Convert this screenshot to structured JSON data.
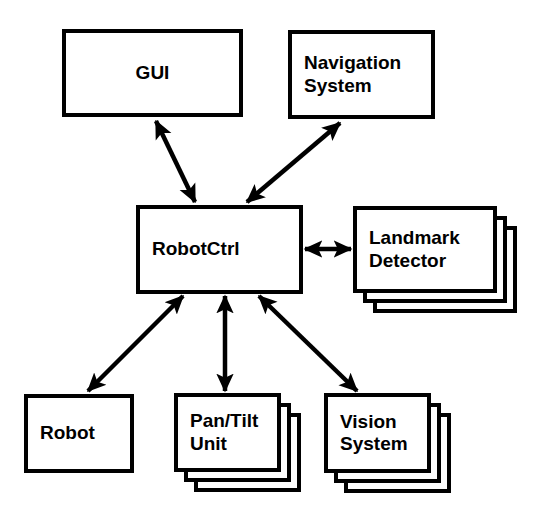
{
  "diagram": {
    "background_color": "#ffffff",
    "line_color": "#000000",
    "nodes": [
      {
        "id": "gui",
        "label": "GUI",
        "x": 62,
        "y": 29,
        "w": 181,
        "h": 88,
        "stacked": false,
        "stack_count": 1,
        "align": "center"
      },
      {
        "id": "navigation-system",
        "label": "Navigation\nSystem",
        "x": 288,
        "y": 30,
        "w": 147,
        "h": 89,
        "stacked": false,
        "stack_count": 1,
        "align": "left"
      },
      {
        "id": "robotctrl",
        "label": "RobotCtrl",
        "x": 136,
        "y": 205,
        "w": 167,
        "h": 89,
        "stacked": false,
        "stack_count": 1,
        "align": "left"
      },
      {
        "id": "landmark-detector",
        "label": "Landmark\nDetector",
        "x": 353,
        "y": 206,
        "w": 144,
        "h": 87,
        "stacked": true,
        "stack_count": 3,
        "align": "left"
      },
      {
        "id": "robot",
        "label": "Robot",
        "x": 24,
        "y": 394,
        "w": 110,
        "h": 79,
        "stacked": false,
        "stack_count": 1,
        "align": "left"
      },
      {
        "id": "pan-tilt-unit",
        "label": "Pan/Tilt\nUnit",
        "x": 174,
        "y": 393,
        "w": 107,
        "h": 79,
        "stacked": true,
        "stack_count": 3,
        "align": "left"
      },
      {
        "id": "vision-system",
        "label": "Vision\nSystem",
        "x": 324,
        "y": 393,
        "w": 107,
        "h": 80,
        "stacked": true,
        "stack_count": 3,
        "align": "left"
      }
    ],
    "stack_offset_x": 10,
    "stack_offset_y": 10,
    "edges": [
      {
        "id": "gui-robotctrl",
        "from": "robotctrl",
        "to": "gui",
        "label": "",
        "arrows": "both",
        "x1": 195,
        "y1": 202,
        "x2": 156,
        "y2": 121
      },
      {
        "id": "robotctrl-navigation",
        "from": "robotctrl",
        "to": "navigation-system",
        "label": "",
        "arrows": "both",
        "x1": 247,
        "y1": 202,
        "x2": 340,
        "y2": 123
      },
      {
        "id": "robotctrl-landmark",
        "from": "robotctrl",
        "to": "landmark-detector",
        "label": "",
        "arrows": "both",
        "x1": 305,
        "y1": 249,
        "x2": 351,
        "y2": 249
      },
      {
        "id": "robotctrl-robot",
        "from": "robotctrl",
        "to": "robot",
        "label": "",
        "arrows": "both",
        "x1": 183,
        "y1": 296,
        "x2": 88,
        "y2": 391
      },
      {
        "id": "robotctrl-pantilt",
        "from": "robotctrl",
        "to": "pan-tilt-unit",
        "label": "",
        "arrows": "both",
        "x1": 225,
        "y1": 296,
        "x2": 225,
        "y2": 391
      },
      {
        "id": "robotctrl-vision",
        "from": "robotctrl",
        "to": "vision-system",
        "label": "",
        "arrows": "both",
        "x1": 259,
        "y1": 296,
        "x2": 357,
        "y2": 391
      }
    ]
  }
}
